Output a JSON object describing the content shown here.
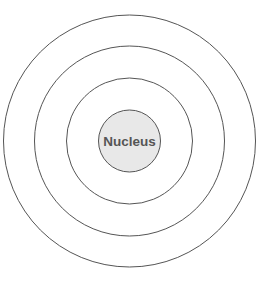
{
  "diagram": {
    "type": "concentric-shells",
    "center": {
      "x": 129.5,
      "y": 141
    },
    "shells": [
      {
        "name": "outer-shell",
        "radius": 126
      },
      {
        "name": "middle-shell",
        "radius": 95
      },
      {
        "name": "inner-shell",
        "radius": 63
      }
    ],
    "nucleus": {
      "label": "Nucleus",
      "radius": 31,
      "fill": "#e8e8e8",
      "text_color": "#555555"
    },
    "stroke_color": "#555555",
    "background": "#ffffff"
  }
}
